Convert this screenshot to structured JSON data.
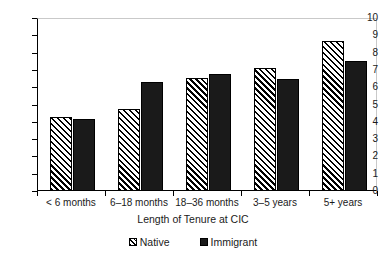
{
  "chart_data": {
    "type": "bar",
    "title": "",
    "subtitle": "",
    "xlabel": "Length of Tenure at CIC",
    "ylabel": "",
    "categories": [
      "< 6 months",
      "6–18 months",
      "18–36 months",
      "3–5 years",
      "5+ years"
    ],
    "series": [
      {
        "name": "Native",
        "values": [
          4.3,
          4.75,
          6.55,
          7.1,
          8.7
        ]
      },
      {
        "name": "Immigrant",
        "values": [
          4.15,
          6.3,
          6.75,
          6.45,
          7.5
        ]
      }
    ],
    "ylim": [
      0,
      10
    ],
    "ytick_values": [
      0,
      1,
      2,
      3,
      4,
      5,
      6,
      7,
      8,
      9,
      10
    ],
    "ytick_labels": [
      "0",
      "1",
      "2",
      "3",
      "4",
      "5",
      "6",
      "7",
      "8",
      "9",
      "10"
    ],
    "grid": false,
    "legend_position": "bottom",
    "legend": [
      {
        "label": "Native",
        "pattern": "diagonal-hatch",
        "color": "#ffffff",
        "edge_color": "#000000"
      },
      {
        "label": "Immigrant",
        "pattern": "solid",
        "color": "#1a1a1a",
        "edge_color": "#000000"
      }
    ]
  },
  "colors": {
    "background": "#ffffff",
    "axis": "#000000",
    "frame_light": "#c9c9c9",
    "text": "#1a1a1a",
    "native_fill": "#ffffff",
    "immigrant_fill": "#1a1a1a"
  }
}
